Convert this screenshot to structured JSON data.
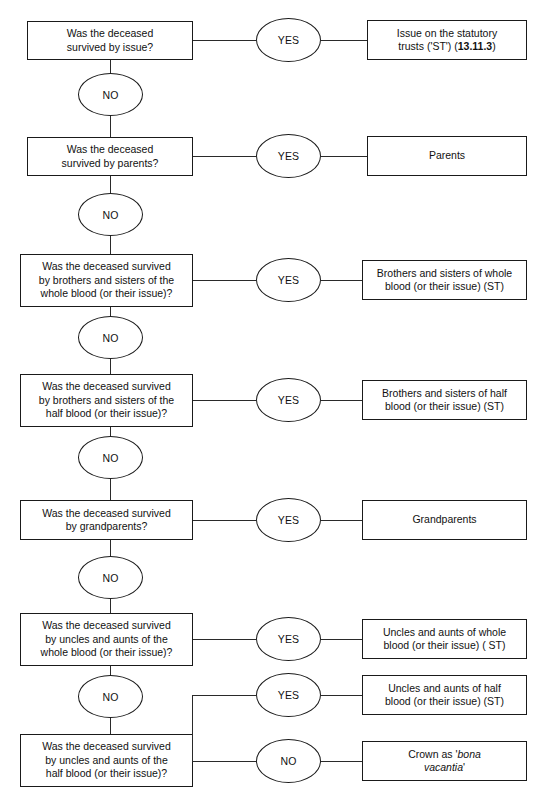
{
  "diagram": {
    "colors": {
      "stroke": "#1a1a1a",
      "background": "#ffffff",
      "text": "#111111"
    },
    "questions": [
      {
        "id": "q-issue",
        "line1": "Was the deceased",
        "line2": "survived by issue?"
      },
      {
        "id": "q-parents",
        "line1": "Was the deceased",
        "line2": "survived by parents?"
      },
      {
        "id": "q-siblings-whole",
        "line1": "Was the deceased survived",
        "line2": "by brothers and sisters of the",
        "line3": "whole blood (or their issue)?"
      },
      {
        "id": "q-siblings-half",
        "line1": "Was the deceased survived",
        "line2": "by brothers and sisters of the",
        "line3": "half blood (or their issue)?"
      },
      {
        "id": "q-grandparents",
        "line1": "Was the deceased survived",
        "line2": "by grandparents?"
      },
      {
        "id": "q-uncles-whole",
        "line1": "Was the deceased survived",
        "line2": "by uncles and aunts of the",
        "line3": "whole blood (or their issue)?"
      },
      {
        "id": "q-uncles-half",
        "line1": "Was the deceased survived",
        "line2": "by uncles and aunts of the",
        "line3": "half blood (or their issue)?"
      }
    ],
    "decisions": {
      "yes": "YES",
      "no": "NO"
    },
    "outcomes": [
      {
        "id": "o-issue",
        "line1": "Issue on the statutory",
        "line2_pre": "trusts ('ST') (",
        "line2_ref": "13.11.3",
        "line2_post": ")"
      },
      {
        "id": "o-parents",
        "line1": "Parents"
      },
      {
        "id": "o-siblings-whole",
        "line1": "Brothers and sisters of whole",
        "line2": "blood (or their issue) (ST)"
      },
      {
        "id": "o-siblings-half",
        "line1": "Brothers and sisters of half",
        "line2": "blood (or their issue) (ST)"
      },
      {
        "id": "o-grandparents",
        "line1": "Grandparents"
      },
      {
        "id": "o-uncles-whole",
        "line1": "Uncles and aunts of whole",
        "line2": "blood (or their issue) ( ST)"
      },
      {
        "id": "o-uncles-half",
        "line1": "Uncles and aunts of half",
        "line2": "blood (or their issue) (ST)"
      },
      {
        "id": "o-crown",
        "line1_pre": "Crown as '",
        "line1_ital": "bona",
        "line2_ital": "vacantia",
        "line2_post": "'"
      }
    ]
  }
}
